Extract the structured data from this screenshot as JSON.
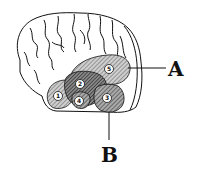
{
  "diagram": {
    "labels": {
      "A": "A",
      "B": "B"
    },
    "regions": [
      {
        "id": "1",
        "label": "1"
      },
      {
        "id": "2",
        "label": "2"
      },
      {
        "id": "3",
        "label": "3"
      },
      {
        "id": "4",
        "label": "4"
      },
      {
        "id": "5",
        "label": "5"
      }
    ],
    "colors": {
      "outline": "#111111",
      "hatch_light": "#9a9a9a",
      "hatch_dark": "#555555",
      "background": "#ffffff"
    }
  }
}
